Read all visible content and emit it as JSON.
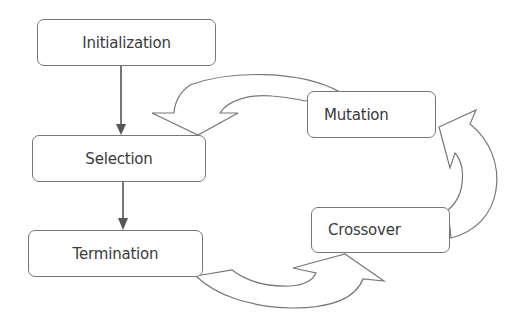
{
  "diagram": {
    "type": "flowchart",
    "title": "",
    "nodes": [
      {
        "id": "initialization",
        "label": "Initialization"
      },
      {
        "id": "selection",
        "label": "Selection"
      },
      {
        "id": "termination",
        "label": "Termination"
      },
      {
        "id": "mutation",
        "label": "Mutation"
      },
      {
        "id": "crossover",
        "label": "Crossover"
      }
    ],
    "edges": [
      {
        "from": "initialization",
        "to": "selection",
        "style": "straight-arrow"
      },
      {
        "from": "selection",
        "to": "termination",
        "style": "straight-arrow"
      },
      {
        "from": "termination",
        "to": "crossover",
        "style": "curved-block-arrow"
      },
      {
        "from": "crossover",
        "to": "mutation",
        "style": "curved-block-arrow"
      },
      {
        "from": "mutation",
        "to": "selection",
        "style": "curved-block-arrow"
      }
    ],
    "colors": {
      "stroke": "#777777",
      "arrow": "#555555",
      "text": "#3a3a3a"
    }
  }
}
